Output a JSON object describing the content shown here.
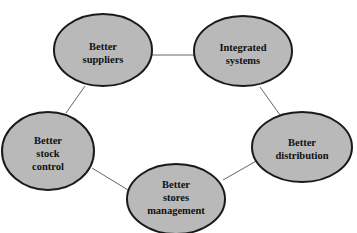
{
  "diagram": {
    "nodes": [
      {
        "id": "suppliers",
        "lines": [
          "Better",
          "suppliers"
        ],
        "cx": 103,
        "cy": 50,
        "rx": 49,
        "ry": 36
      },
      {
        "id": "integrated",
        "lines": [
          "Integrated",
          "systems"
        ],
        "cx": 243,
        "cy": 51,
        "rx": 49,
        "ry": 35
      },
      {
        "id": "stock",
        "lines": [
          "Better",
          "stock",
          "control"
        ],
        "cx": 48,
        "cy": 151,
        "rx": 46,
        "ry": 39
      },
      {
        "id": "distribution",
        "lines": [
          "Better",
          "distribution"
        ],
        "cx": 302,
        "cy": 147,
        "rx": 50,
        "ry": 35
      },
      {
        "id": "stores",
        "lines": [
          "Better",
          "stores",
          "management"
        ],
        "cx": 176,
        "cy": 199,
        "rx": 49,
        "ry": 35
      }
    ],
    "edges": [
      [
        "suppliers",
        "integrated"
      ],
      [
        "integrated",
        "distribution"
      ],
      [
        "distribution",
        "stores"
      ],
      [
        "stores",
        "stock"
      ],
      [
        "stock",
        "suppliers"
      ]
    ],
    "colors": {
      "fill": "#b9b9b9",
      "stroke": "#1a1a1a",
      "edge": "#666666"
    }
  }
}
